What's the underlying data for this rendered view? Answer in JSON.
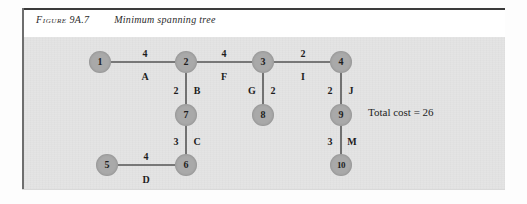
{
  "figure": {
    "label_word": "Figure",
    "number": "9A.7",
    "title": "Minimum spanning tree"
  },
  "annotation": {
    "total_cost": "Total cost = 26"
  },
  "colors": {
    "node_fill": "#a9a9a9",
    "panel_bg": "#e4e4e4",
    "edge_stroke": "#555555",
    "text": "#1d1d1d",
    "frame": "#3a3a3a"
  },
  "chart_data": {
    "type": "diagram",
    "title": "Minimum spanning tree",
    "total_cost": 26,
    "nodes": [
      {
        "id": "1",
        "label": "1",
        "x": 100,
        "y": 62
      },
      {
        "id": "2",
        "label": "2",
        "x": 186,
        "y": 62
      },
      {
        "id": "3",
        "label": "3",
        "x": 263,
        "y": 62
      },
      {
        "id": "4",
        "label": "4",
        "x": 341,
        "y": 62
      },
      {
        "id": "7",
        "label": "7",
        "x": 186,
        "y": 115
      },
      {
        "id": "8",
        "label": "8",
        "x": 263,
        "y": 115
      },
      {
        "id": "9",
        "label": "9",
        "x": 341,
        "y": 115
      },
      {
        "id": "5",
        "label": "5",
        "x": 107,
        "y": 165
      },
      {
        "id": "6",
        "label": "6",
        "x": 186,
        "y": 165
      },
      {
        "id": "10",
        "label": "10",
        "x": 341,
        "y": 165
      }
    ],
    "edges": [
      {
        "name": "A",
        "from": "1",
        "to": "2",
        "weight": 4,
        "x1": 111,
        "y1": 62,
        "x2": 175,
        "y2": 62
      },
      {
        "name": "F",
        "from": "2",
        "to": "3",
        "weight": 4,
        "x1": 197,
        "y1": 62,
        "x2": 252,
        "y2": 62
      },
      {
        "name": "I",
        "from": "3",
        "to": "4",
        "weight": 2,
        "x1": 274,
        "y1": 62,
        "x2": 330,
        "y2": 62
      },
      {
        "name": "B",
        "from": "2",
        "to": "7",
        "weight": 2,
        "x1": 186,
        "y1": 73,
        "x2": 186,
        "y2": 104
      },
      {
        "name": "G",
        "from": "3",
        "to": "8",
        "weight": 2,
        "x1": 263,
        "y1": 73,
        "x2": 263,
        "y2": 104
      },
      {
        "name": "J",
        "from": "4",
        "to": "9",
        "weight": 2,
        "x1": 341,
        "y1": 73,
        "x2": 341,
        "y2": 104
      },
      {
        "name": "C",
        "from": "7",
        "to": "6",
        "weight": 3,
        "x1": 186,
        "y1": 126,
        "x2": 186,
        "y2": 154
      },
      {
        "name": "M",
        "from": "9",
        "to": "10",
        "weight": 3,
        "x1": 341,
        "y1": 126,
        "x2": 341,
        "y2": 154
      },
      {
        "name": "D",
        "from": "5",
        "to": "6",
        "weight": 4,
        "x1": 118,
        "y1": 165,
        "x2": 175,
        "y2": 165
      }
    ],
    "edge_labels": [
      {
        "text": "4",
        "kind": "weight",
        "edge": "A",
        "x": 145,
        "y": 53
      },
      {
        "text": "A",
        "kind": "name",
        "edge": "A",
        "x": 145,
        "y": 76
      },
      {
        "text": "4",
        "kind": "weight",
        "edge": "F",
        "x": 224,
        "y": 53
      },
      {
        "text": "F",
        "kind": "name",
        "edge": "F",
        "x": 224,
        "y": 76
      },
      {
        "text": "2",
        "kind": "weight",
        "edge": "I",
        "x": 303,
        "y": 53
      },
      {
        "text": "I",
        "kind": "name",
        "edge": "I",
        "x": 303,
        "y": 76
      },
      {
        "text": "2",
        "kind": "weight",
        "edge": "B",
        "x": 176,
        "y": 90
      },
      {
        "text": "B",
        "kind": "name",
        "edge": "B",
        "x": 197,
        "y": 90
      },
      {
        "text": "G",
        "kind": "name",
        "edge": "G",
        "x": 252,
        "y": 90
      },
      {
        "text": "2",
        "kind": "weight",
        "edge": "G",
        "x": 273,
        "y": 90
      },
      {
        "text": "2",
        "kind": "weight",
        "edge": "J",
        "x": 330,
        "y": 90
      },
      {
        "text": "J",
        "kind": "name",
        "edge": "J",
        "x": 351,
        "y": 90
      },
      {
        "text": "3",
        "kind": "weight",
        "edge": "C",
        "x": 176,
        "y": 141
      },
      {
        "text": "C",
        "kind": "name",
        "edge": "C",
        "x": 197,
        "y": 141
      },
      {
        "text": "3",
        "kind": "weight",
        "edge": "M",
        "x": 330,
        "y": 141
      },
      {
        "text": "M",
        "kind": "name",
        "edge": "M",
        "x": 352,
        "y": 141
      },
      {
        "text": "4",
        "kind": "weight",
        "edge": "D",
        "x": 146,
        "y": 156
      },
      {
        "text": "D",
        "kind": "name",
        "edge": "D",
        "x": 146,
        "y": 179
      }
    ]
  }
}
